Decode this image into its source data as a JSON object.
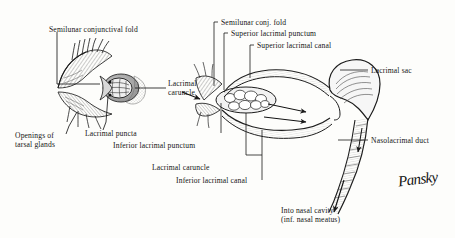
{
  "figure": {
    "signature": "Pansky",
    "ink_color": "#1a1a1a",
    "paper_color": "#fdfdfb"
  },
  "labels": {
    "semilunar_conjunctival_fold": "Semilunar conjunctival fold",
    "lacrimal_caruncle_left": "Lacrimal\ncaruncle",
    "lacrimal_puncta": "Lacrimal puncta",
    "openings_of_tarsal_glands": "Openings of\ntarsal glands",
    "semilunar_conj_fold": "Semilunar conj. fold",
    "superior_lacrimal_punctum": "Superior lacrimal punctum",
    "superior_lacrimal_canal": "Superior lacrimal canal",
    "lacrimal_sac": "Lacrimal sac",
    "nasolacrimal_duct": "Nasolacrimal duct",
    "inferior_lacrimal_punctum": "Inferior lacrimal punctum",
    "lacrimal_caruncle_right": "Lacrimal caruncle",
    "inferior_lacrimal_canal": "Inferior lacrimal canal",
    "into_nasal_cavity_line1": "Into nasal cavity",
    "into_nasal_cavity_line2": "(inf. nasal meatus)"
  }
}
